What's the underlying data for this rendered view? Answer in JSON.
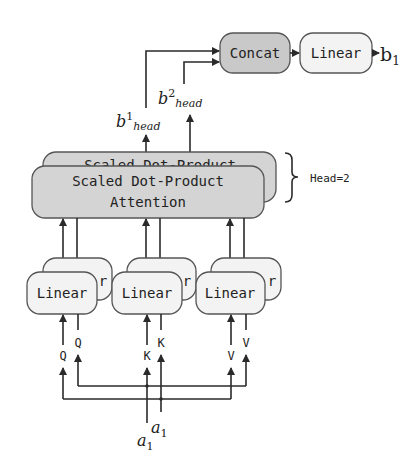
{
  "diagram": {
    "concat_label": "Concat",
    "output_linear_label": "Linear",
    "output_label_base": "b",
    "output_label_sub": "1",
    "head_outputs": [
      {
        "base": "b",
        "sup": "1",
        "sub": "head"
      },
      {
        "base": "b",
        "sup": "2",
        "sub": "head"
      }
    ],
    "attention": {
      "back_label": "Scaled Dot-Product",
      "front_line1": "Scaled Dot-Product",
      "front_line2": "Attention"
    },
    "head_count_label": "Head=2",
    "linear_label": "Linear",
    "linear_back_visible": "r",
    "projections": [
      {
        "name": "Q",
        "front": "Q",
        "back": "Q"
      },
      {
        "name": "K",
        "front": "K",
        "back": "K"
      },
      {
        "name": "V",
        "front": "V",
        "back": "V"
      }
    ],
    "inputs": [
      {
        "base": "a",
        "sub": "1"
      },
      {
        "base": "a",
        "sub": "1"
      }
    ],
    "colors": {
      "concat_fill": "#c9c9c9",
      "attention_fill": "#d4d4d4",
      "linear_fill": "#f3f3f3",
      "stroke": "#2a2a2a"
    }
  }
}
